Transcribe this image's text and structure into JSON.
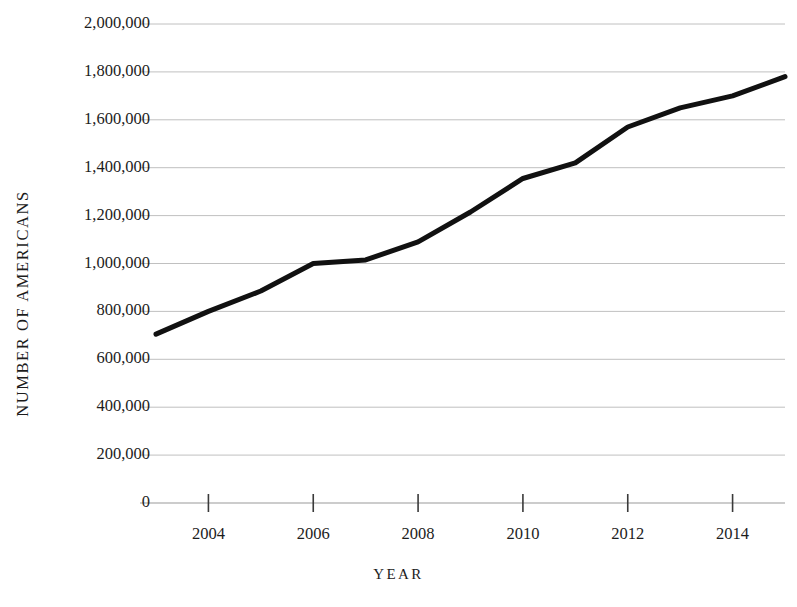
{
  "chart_data": {
    "type": "line",
    "title": "",
    "xlabel": "YEAR",
    "ylabel": "NUMBER OF AMERICANS",
    "x": [
      2003,
      2004,
      2005,
      2006,
      2007,
      2008,
      2009,
      2010,
      2011,
      2012,
      2013,
      2014,
      2015
    ],
    "values": [
      705000,
      800000,
      885000,
      1000000,
      1015000,
      1090000,
      1215000,
      1355000,
      1420000,
      1570000,
      1650000,
      1700000,
      1780000
    ],
    "series": [
      {
        "name": "Number of Americans",
        "values": [
          705000,
          800000,
          885000,
          1000000,
          1015000,
          1090000,
          1215000,
          1355000,
          1420000,
          1570000,
          1650000,
          1700000,
          1780000
        ]
      }
    ],
    "xlim": [
      2003,
      2015
    ],
    "ylim": [
      0,
      2000000
    ],
    "ytick_values": [
      0,
      200000,
      400000,
      600000,
      800000,
      1000000,
      1200000,
      1400000,
      1600000,
      1800000,
      2000000
    ],
    "ytick_labels": [
      "0",
      "200,000",
      "400,000",
      "600,000",
      "800,000",
      "1,000,000",
      "1,200,000",
      "1,400,000",
      "1,600,000",
      "1,800,000",
      "2,000,000"
    ],
    "xtick_values": [
      2004,
      2006,
      2008,
      2010,
      2012,
      2014
    ],
    "xtick_labels": [
      "2004",
      "2006",
      "2008",
      "2010",
      "2012",
      "2014"
    ],
    "grid": true,
    "grid_axis": "y",
    "legend": false,
    "legend_position": "none",
    "line_color": "#111111",
    "line_width": 5,
    "grid_color": "#b9b9b9",
    "axis_color": "#9a9a9a",
    "background_color": "#ffffff"
  }
}
